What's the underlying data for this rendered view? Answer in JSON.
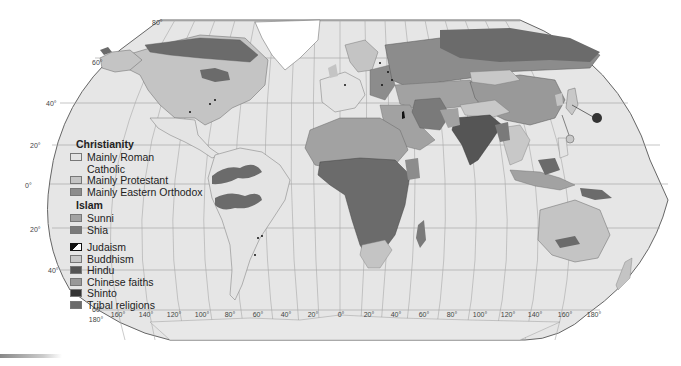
{
  "map": {
    "title": "World religions",
    "projection": "Robinson",
    "colors": {
      "ocean": "#e6e6e6",
      "graticule": "#9a9a9a",
      "outline": "#666666",
      "roman_catholic": "#d8d8d8",
      "protestant": "#c4c4c4",
      "eastern_orthodox": "#8c8c8c",
      "sunni": "#a2a2a2",
      "shia": "#7a7a7a",
      "buddhism": "#c8c8c8",
      "hindu": "#555555",
      "chinese_faiths": "#999999",
      "shinto": "#333333",
      "tribal": "#6b6b6b",
      "ice": "#ffffff"
    },
    "latitude_labels_left": [
      "80°",
      "60°",
      "40°",
      "20°",
      "0°",
      "20°",
      "40°",
      "60°"
    ],
    "longitude_labels": [
      "180°",
      "160°",
      "140°",
      "120°",
      "100°",
      "80°",
      "60°",
      "40°",
      "20°",
      "0°",
      "20°",
      "40°",
      "60°",
      "80°",
      "100°",
      "120°",
      "140°",
      "160°",
      "180°"
    ]
  },
  "legend": {
    "christianity": {
      "heading": "Christianity",
      "items": [
        {
          "label": "Mainly Roman",
          "label2": "Catholic",
          "color": "#e4e4e4"
        },
        {
          "label": "Mainly Protestant",
          "color": "#c4c4c4"
        },
        {
          "label": "Mainly Eastern Orthodox",
          "color": "#8c8c8c"
        }
      ]
    },
    "islam": {
      "heading": "Islam",
      "items": [
        {
          "label": "Sunni",
          "color": "#a2a2a2"
        },
        {
          "label": "Shia",
          "color": "#7a7a7a"
        }
      ]
    },
    "other": [
      {
        "label": "Judaism",
        "color": "pattern"
      },
      {
        "label": "Buddhism",
        "color": "#c8c8c8"
      },
      {
        "label": "Hindu",
        "color": "#555555"
      },
      {
        "label": "Chinese faiths",
        "color": "#999999"
      },
      {
        "label": "Shinto",
        "color": "#333333"
      },
      {
        "label": "Tribal religions",
        "color": "#6b6b6b"
      }
    ]
  }
}
